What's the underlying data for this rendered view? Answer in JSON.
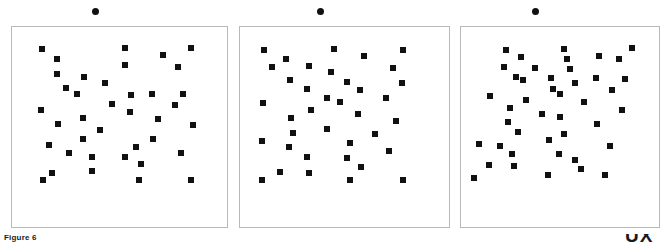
{
  "figure": {
    "caption": "Figure 6",
    "corner_mark": "UX",
    "background_color": "#ffffff",
    "marker_color": "#111111",
    "panel_border_color": "#b9b9b9"
  },
  "chart_data": {
    "type": "scatter",
    "title": "Figure 6",
    "xlabel": "",
    "ylabel": "",
    "grid": false,
    "legend": null,
    "marker": "square",
    "marker_size_px": 6,
    "panel_count": 3,
    "xlim": [
      0,
      100
    ],
    "ylim": [
      0,
      100
    ],
    "panels": [
      {
        "name": "panel-1",
        "header_dot": true,
        "bounds_px": {
          "x": 11,
          "y": 26,
          "w": 217,
          "h": 202
        },
        "points": [
          {
            "x": 13.8,
            "y": 89.1
          },
          {
            "x": 20.7,
            "y": 84.2
          },
          {
            "x": 52.5,
            "y": 89.6
          },
          {
            "x": 52.5,
            "y": 81.2
          },
          {
            "x": 70.0,
            "y": 86.1
          },
          {
            "x": 83.4,
            "y": 89.6
          },
          {
            "x": 20.7,
            "y": 76.7
          },
          {
            "x": 33.6,
            "y": 75.2
          },
          {
            "x": 77.4,
            "y": 80.2
          },
          {
            "x": 25.3,
            "y": 69.3
          },
          {
            "x": 43.3,
            "y": 71.8
          },
          {
            "x": 30.0,
            "y": 66.3
          },
          {
            "x": 55.3,
            "y": 65.8
          },
          {
            "x": 65.0,
            "y": 66.3
          },
          {
            "x": 79.7,
            "y": 66.3
          },
          {
            "x": 46.5,
            "y": 61.4
          },
          {
            "x": 76.0,
            "y": 60.9
          },
          {
            "x": 13.4,
            "y": 58.4
          },
          {
            "x": 54.8,
            "y": 57.4
          },
          {
            "x": 33.2,
            "y": 54.5
          },
          {
            "x": 67.7,
            "y": 54.0
          },
          {
            "x": 21.2,
            "y": 51.5
          },
          {
            "x": 84.3,
            "y": 51.0
          },
          {
            "x": 41.0,
            "y": 48.5
          },
          {
            "x": 33.2,
            "y": 44.1
          },
          {
            "x": 65.4,
            "y": 44.1
          },
          {
            "x": 17.1,
            "y": 41.1
          },
          {
            "x": 57.6,
            "y": 40.1
          },
          {
            "x": 26.7,
            "y": 37.1
          },
          {
            "x": 78.8,
            "y": 37.1
          },
          {
            "x": 37.3,
            "y": 35.1
          },
          {
            "x": 52.5,
            "y": 35.1
          },
          {
            "x": 60.0,
            "y": 31.7
          },
          {
            "x": 37.3,
            "y": 28.2
          },
          {
            "x": 18.4,
            "y": 27.2
          },
          {
            "x": 14.3,
            "y": 23.3
          },
          {
            "x": 59.0,
            "y": 23.3
          },
          {
            "x": 83.4,
            "y": 23.3
          }
        ]
      },
      {
        "name": "panel-2",
        "header_dot": true,
        "bounds_px": {
          "x": 239,
          "y": 26,
          "w": 211,
          "h": 202
        },
        "points": [
          {
            "x": 11.5,
            "y": 88.6
          },
          {
            "x": 22.0,
            "y": 84.2
          },
          {
            "x": 45.0,
            "y": 89.1
          },
          {
            "x": 59.5,
            "y": 85.6
          },
          {
            "x": 78.0,
            "y": 88.6
          },
          {
            "x": 15.5,
            "y": 80.2
          },
          {
            "x": 33.0,
            "y": 80.7
          },
          {
            "x": 43.5,
            "y": 77.7
          },
          {
            "x": 73.0,
            "y": 79.7
          },
          {
            "x": 24.0,
            "y": 73.3
          },
          {
            "x": 51.0,
            "y": 72.3
          },
          {
            "x": 57.5,
            "y": 68.3
          },
          {
            "x": 77.5,
            "y": 71.8
          },
          {
            "x": 32.0,
            "y": 68.8
          },
          {
            "x": 41.5,
            "y": 64.4
          },
          {
            "x": 48.0,
            "y": 62.4
          },
          {
            "x": 70.0,
            "y": 64.4
          },
          {
            "x": 11.0,
            "y": 61.9
          },
          {
            "x": 34.0,
            "y": 58.4
          },
          {
            "x": 56.5,
            "y": 56.4
          },
          {
            "x": 24.5,
            "y": 54.5
          },
          {
            "x": 74.5,
            "y": 53.0
          },
          {
            "x": 41.5,
            "y": 49.0
          },
          {
            "x": 25.5,
            "y": 47.0
          },
          {
            "x": 64.5,
            "y": 46.5
          },
          {
            "x": 10.5,
            "y": 43.1
          },
          {
            "x": 52.5,
            "y": 42.1
          },
          {
            "x": 23.5,
            "y": 40.1
          },
          {
            "x": 71.5,
            "y": 38.1
          },
          {
            "x": 32.0,
            "y": 35.1
          },
          {
            "x": 51.0,
            "y": 34.6
          },
          {
            "x": 58.0,
            "y": 30.2
          },
          {
            "x": 19.0,
            "y": 27.7
          },
          {
            "x": 33.0,
            "y": 27.2
          },
          {
            "x": 10.5,
            "y": 23.3
          },
          {
            "x": 52.5,
            "y": 23.3
          },
          {
            "x": 78.0,
            "y": 23.3
          }
        ]
      },
      {
        "name": "panel-3",
        "header_dot": true,
        "bounds_px": {
          "x": 460,
          "y": 26,
          "w": 200,
          "h": 202
        },
        "points": [
          {
            "x": 22.5,
            "y": 88.6
          },
          {
            "x": 52.0,
            "y": 89.1
          },
          {
            "x": 86.5,
            "y": 89.6
          },
          {
            "x": 30.5,
            "y": 85.1
          },
          {
            "x": 53.5,
            "y": 84.2
          },
          {
            "x": 69.5,
            "y": 85.6
          },
          {
            "x": 80.0,
            "y": 84.2
          },
          {
            "x": 21.5,
            "y": 80.2
          },
          {
            "x": 37.5,
            "y": 79.7
          },
          {
            "x": 55.0,
            "y": 79.2
          },
          {
            "x": 28.0,
            "y": 75.2
          },
          {
            "x": 31.5,
            "y": 73.3
          },
          {
            "x": 45.5,
            "y": 74.7
          },
          {
            "x": 68.0,
            "y": 74.7
          },
          {
            "x": 83.0,
            "y": 73.8
          },
          {
            "x": 57.5,
            "y": 71.8
          },
          {
            "x": 46.5,
            "y": 68.8
          },
          {
            "x": 50.0,
            "y": 66.3
          },
          {
            "x": 76.5,
            "y": 68.3
          },
          {
            "x": 14.5,
            "y": 65.3
          },
          {
            "x": 33.0,
            "y": 63.4
          },
          {
            "x": 62.0,
            "y": 62.4
          },
          {
            "x": 24.5,
            "y": 59.4
          },
          {
            "x": 41.0,
            "y": 56.4
          },
          {
            "x": 50.0,
            "y": 55.0
          },
          {
            "x": 81.5,
            "y": 58.4
          },
          {
            "x": 23.5,
            "y": 52.5
          },
          {
            "x": 68.5,
            "y": 51.5
          },
          {
            "x": 29.0,
            "y": 47.5
          },
          {
            "x": 52.0,
            "y": 46.5
          },
          {
            "x": 44.5,
            "y": 43.6
          },
          {
            "x": 9.0,
            "y": 41.6
          },
          {
            "x": 19.5,
            "y": 40.6
          },
          {
            "x": 75.0,
            "y": 40.6
          },
          {
            "x": 49.5,
            "y": 36.6
          },
          {
            "x": 26.0,
            "y": 36.6
          },
          {
            "x": 57.5,
            "y": 33.7
          },
          {
            "x": 14.0,
            "y": 31.2
          },
          {
            "x": 27.0,
            "y": 30.7
          },
          {
            "x": 60.5,
            "y": 29.2
          },
          {
            "x": 44.0,
            "y": 26.2
          },
          {
            "x": 72.5,
            "y": 26.2
          },
          {
            "x": 6.5,
            "y": 24.3
          }
        ]
      }
    ]
  }
}
